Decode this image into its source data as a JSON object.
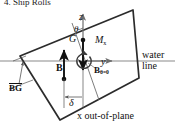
{
  "figure": {
    "caption": "4. Ship Rolls",
    "colors": {
      "hull_stroke": "#2b2b2b",
      "axis": "#6e6e6e",
      "waterline": "#8a8a8a",
      "force_arrow": "#111111",
      "moment_arrow": "#3a3a3a",
      "dimension": "#555555",
      "text": "#111111",
      "background": "#ffffff"
    },
    "labels": {
      "z_axis": "z",
      "y_axis": "y",
      "theta": "θ",
      "center_of_gravity": "G",
      "center_of_buoyancy": "B",
      "buoyancy_upright": "B",
      "buoyancy_upright_sub": "θ=0",
      "moment": "M",
      "moment_sub": "x",
      "distance_bg": "BG",
      "offset": "δ",
      "waterline_line1": "water",
      "waterline_line2": "line",
      "out_of_plane": "x out-of-plane"
    },
    "annotations": [
      {
        "name": "z-axis-label",
        "text": "z"
      },
      {
        "name": "y-axis-label",
        "text": "y"
      },
      {
        "name": "heel-angle-label",
        "text": "θ"
      },
      {
        "name": "center-of-gravity-label",
        "text": "G"
      },
      {
        "name": "center-of-buoyancy-label",
        "text": "B"
      },
      {
        "name": "upright-buoyancy-label",
        "text": "Bθ=0"
      },
      {
        "name": "righting-moment-label",
        "text": "Mx"
      },
      {
        "name": "bg-distance-label",
        "text": "BG"
      },
      {
        "name": "delta-offset-label",
        "text": "δ"
      },
      {
        "name": "waterline-label",
        "text": "water line"
      },
      {
        "name": "out-of-plane-label",
        "text": "x out-of-plane"
      }
    ]
  }
}
